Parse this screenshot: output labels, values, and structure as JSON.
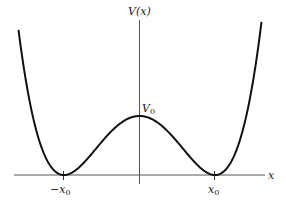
{
  "diagram": {
    "y_axis_label": "V(x)",
    "x_axis_label": "x",
    "peak_label": "V",
    "peak_label_sub": "0",
    "left_min_label": "−x",
    "left_min_label_sub": "0",
    "right_min_label": "x",
    "right_min_label_sub": "0",
    "colors": {
      "curve": "#111111",
      "axis": "#555555",
      "background": "#ffffff"
    }
  },
  "chart_data": {
    "type": "line",
    "title": "",
    "xlabel": "x",
    "ylabel": "V(x)",
    "function": "V(x) = V0 * (1 - (x/x0)^2)^2",
    "x_ticks": [
      "-x0",
      "x0"
    ],
    "annotations": [
      "V0"
    ],
    "series": [
      {
        "name": "V(x)",
        "x": [
          -1.6,
          -1.4,
          -1.2,
          -1.0,
          -0.8,
          -0.6,
          -0.4,
          -0.2,
          0.0,
          0.2,
          0.4,
          0.6,
          0.8,
          1.0,
          1.2,
          1.4,
          1.6
        ],
        "values": [
          2.43,
          0.92,
          0.19,
          0.0,
          0.13,
          0.41,
          0.71,
          0.92,
          1.0,
          0.92,
          0.71,
          0.41,
          0.13,
          0.0,
          0.19,
          0.92,
          2.43
        ]
      }
    ],
    "grid": false
  }
}
